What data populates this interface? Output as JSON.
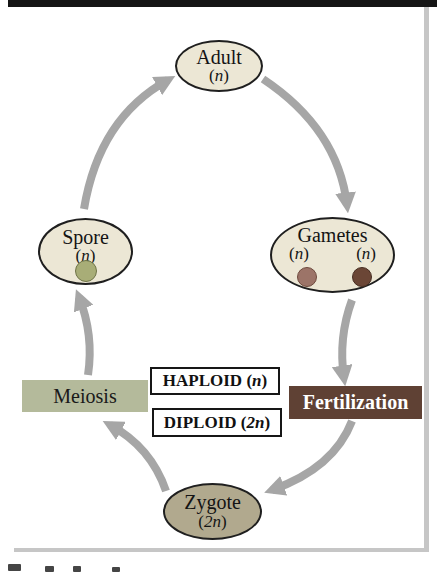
{
  "nodes": {
    "adult": {
      "label": "Adult",
      "ploidy": {
        "open": "(",
        "sym": "n",
        "close": ")"
      }
    },
    "spore": {
      "label": "Spore",
      "ploidy": {
        "open": "(",
        "sym": "n",
        "close": ")"
      }
    },
    "gametes": {
      "label": "Gametes",
      "ploidy": {
        "open": "(",
        "sym": "n",
        "close": ")"
      }
    },
    "zygote": {
      "label": "Zygote",
      "ploidy": {
        "open": "(",
        "sym": "2n",
        "close": ")"
      }
    }
  },
  "process": {
    "meiosis": "Meiosis",
    "fertilization": "Fertilization"
  },
  "phases": {
    "haploid": {
      "word": "HAPLOID",
      "open": " (",
      "sym": "n",
      "close": ")"
    },
    "diploid": {
      "word": "DIPLOID",
      "open": " (",
      "sym": "2n",
      "close": ")"
    }
  },
  "palette": {
    "oval_fill": "#ece7d5",
    "zygote_fill": "#b1a98e",
    "meiosis_bg": "#b4ba9b",
    "fertilization_bg": "#5f4134",
    "fertilization_text": "#ffffff",
    "arrow": "#a6a6a6",
    "top_rule": "#151515",
    "frame_gray": "#c6c6c6",
    "spore_cell_fill": "#a8ad77",
    "spore_cell_stroke": "#6e7347",
    "gamete_left_fill": "#9c7468",
    "gamete_left_stroke": "#6f4a3e",
    "gamete_right_fill": "#6b4636",
    "gamete_right_stroke": "#472d22"
  }
}
